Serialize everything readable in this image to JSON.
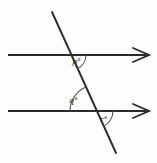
{
  "figure": {
    "type": "geometry-diagram",
    "background_color": "#fdfdfd",
    "stroke_color": "#2b2b2b",
    "arc_color": "#555555",
    "labels": {
      "p": "p°",
      "q": "q°",
      "r": "r°"
    },
    "lines": [
      {
        "name": "upper-parallel-line",
        "x1": 8,
        "y1": 55,
        "x2": 148,
        "y2": 55,
        "arrow": "right",
        "arrow_count": 1
      },
      {
        "name": "lower-parallel-line",
        "x1": 8,
        "y1": 111,
        "x2": 148,
        "y2": 111,
        "arrow": "right",
        "arrow_count": 1
      },
      {
        "name": "transversal-line",
        "x1": 52,
        "y1": 12,
        "x2": 116,
        "y2": 153,
        "arrow": "none",
        "arrow_count": 0
      }
    ],
    "intersections": [
      {
        "name": "upper-intersection",
        "x": 71,
        "y": 55
      },
      {
        "name": "lower-intersection",
        "x": 96,
        "y": 111
      }
    ],
    "arcs": [
      {
        "name": "angle-arc-p",
        "vertex_x": 71,
        "vertex_y": 55,
        "radius": 15,
        "start_angle": 0,
        "end_angle": 66
      },
      {
        "name": "angle-arc-q",
        "vertex_x": 96,
        "vertex_y": 111,
        "radius": 26,
        "start_angle": 114,
        "end_angle": 180
      },
      {
        "name": "angle-arc-r",
        "vertex_x": 96,
        "vertex_y": 111,
        "radius": 17,
        "start_angle": -66,
        "end_angle": 0
      }
    ]
  }
}
